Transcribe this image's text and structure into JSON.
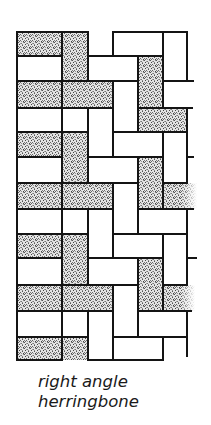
{
  "figure": {
    "caption_lines": [
      "right angle",
      "herringbone"
    ],
    "colors": {
      "line": "#141414",
      "stipple": "#6e6e6e",
      "background": "#ffffff"
    },
    "bricks": [
      {
        "x": 17,
        "y": 32,
        "w": 45,
        "h": 24,
        "fill": "dotted"
      },
      {
        "x": 62,
        "y": 32,
        "w": 26,
        "h": 49,
        "fill": "dotted"
      },
      {
        "x": 113,
        "y": 32,
        "w": 50,
        "h": 24,
        "fill": "white"
      },
      {
        "x": 163,
        "y": 32,
        "w": 24,
        "h": 49,
        "fill": "white"
      },
      {
        "x": 17,
        "y": 56,
        "w": 45,
        "h": 25,
        "fill": "white"
      },
      {
        "x": 88,
        "y": 56,
        "w": 50,
        "h": 25,
        "fill": "white"
      },
      {
        "x": 138,
        "y": 56,
        "w": 25,
        "h": 52,
        "fill": "dotted"
      },
      {
        "x": 17,
        "y": 81,
        "w": 45,
        "h": 27,
        "fill": "dotted"
      },
      {
        "x": 62,
        "y": 81,
        "w": 51,
        "h": 27,
        "fill": "dotted"
      },
      {
        "x": 113,
        "y": 81,
        "w": 25,
        "h": 51,
        "fill": "white"
      },
      {
        "x": 17,
        "y": 108,
        "w": 45,
        "h": 24,
        "fill": "white"
      },
      {
        "x": 62,
        "y": 108,
        "w": 26,
        "h": 24,
        "fill": "white"
      },
      {
        "x": 88,
        "y": 108,
        "w": 25,
        "h": 49,
        "fill": "white"
      },
      {
        "x": 138,
        "y": 108,
        "w": 49,
        "h": 24,
        "fill": "dotted"
      },
      {
        "x": 17,
        "y": 132,
        "w": 45,
        "h": 25,
        "fill": "dotted"
      },
      {
        "x": 62,
        "y": 132,
        "w": 26,
        "h": 51,
        "fill": "dotted"
      },
      {
        "x": 113,
        "y": 132,
        "w": 50,
        "h": 25,
        "fill": "white"
      },
      {
        "x": 163,
        "y": 132,
        "w": 24,
        "h": 51,
        "fill": "white"
      },
      {
        "x": 17,
        "y": 157,
        "w": 45,
        "h": 26,
        "fill": "white"
      },
      {
        "x": 88,
        "y": 157,
        "w": 50,
        "h": 26,
        "fill": "white"
      },
      {
        "x": 138,
        "y": 157,
        "w": 25,
        "h": 52,
        "fill": "dotted"
      },
      {
        "x": 17,
        "y": 183,
        "w": 45,
        "h": 26,
        "fill": "dotted"
      },
      {
        "x": 62,
        "y": 183,
        "w": 51,
        "h": 26,
        "fill": "dotted"
      },
      {
        "x": 113,
        "y": 183,
        "w": 25,
        "h": 51,
        "fill": "white"
      },
      {
        "x": 163,
        "y": 183,
        "w": 34,
        "h": 26,
        "fill": "dotted",
        "open_right": true
      },
      {
        "x": 17,
        "y": 209,
        "w": 45,
        "h": 25,
        "fill": "white"
      },
      {
        "x": 62,
        "y": 209,
        "w": 26,
        "h": 25,
        "fill": "white"
      },
      {
        "x": 88,
        "y": 209,
        "w": 25,
        "h": 49,
        "fill": "white"
      },
      {
        "x": 138,
        "y": 209,
        "w": 49,
        "h": 25,
        "fill": "white"
      },
      {
        "x": 17,
        "y": 234,
        "w": 45,
        "h": 24,
        "fill": "dotted"
      },
      {
        "x": 62,
        "y": 234,
        "w": 26,
        "h": 51,
        "fill": "dotted"
      },
      {
        "x": 113,
        "y": 234,
        "w": 50,
        "h": 24,
        "fill": "white"
      },
      {
        "x": 163,
        "y": 234,
        "w": 24,
        "h": 51,
        "fill": "white"
      },
      {
        "x": 17,
        "y": 258,
        "w": 45,
        "h": 27,
        "fill": "white"
      },
      {
        "x": 88,
        "y": 258,
        "w": 50,
        "h": 27,
        "fill": "white"
      },
      {
        "x": 138,
        "y": 258,
        "w": 25,
        "h": 53,
        "fill": "dotted"
      },
      {
        "x": 17,
        "y": 285,
        "w": 45,
        "h": 26,
        "fill": "dotted"
      },
      {
        "x": 62,
        "y": 285,
        "w": 51,
        "h": 26,
        "fill": "dotted"
      },
      {
        "x": 113,
        "y": 285,
        "w": 25,
        "h": 52,
        "fill": "white"
      },
      {
        "x": 163,
        "y": 285,
        "w": 32,
        "h": 26,
        "fill": "dotted",
        "open_right": true
      },
      {
        "x": 17,
        "y": 311,
        "w": 45,
        "h": 26,
        "fill": "white"
      },
      {
        "x": 62,
        "y": 311,
        "w": 26,
        "h": 26,
        "fill": "white"
      },
      {
        "x": 88,
        "y": 311,
        "w": 25,
        "h": 49,
        "fill": "white"
      },
      {
        "x": 138,
        "y": 311,
        "w": 49,
        "h": 26,
        "fill": "white"
      },
      {
        "x": 17,
        "y": 337,
        "w": 45,
        "h": 23,
        "fill": "dotted"
      },
      {
        "x": 62,
        "y": 337,
        "w": 26,
        "h": 23,
        "fill": "dotted",
        "open_bottom": true
      },
      {
        "x": 113,
        "y": 337,
        "w": 50,
        "h": 23,
        "fill": "white"
      },
      {
        "x": 163,
        "y": 337,
        "w": 24,
        "h": 23,
        "fill": "white",
        "open_bottom": true
      }
    ],
    "ticks": [
      {
        "x1": 187,
        "y1": 81,
        "x2": 193,
        "y2": 81
      },
      {
        "x1": 187,
        "y1": 108,
        "x2": 192,
        "y2": 108
      },
      {
        "x1": 187,
        "y1": 157,
        "x2": 193,
        "y2": 157
      },
      {
        "x1": 187,
        "y1": 258,
        "x2": 196,
        "y2": 258
      }
    ]
  }
}
